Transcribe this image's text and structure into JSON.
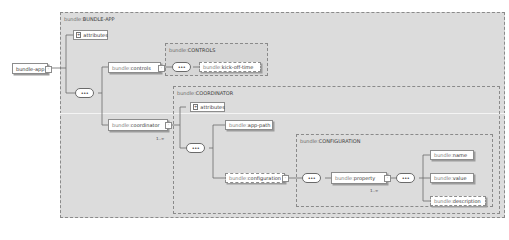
{
  "groups": {
    "bundle_app": {
      "ns": "bundle:",
      "name": "BUNDLE-APP"
    },
    "controls": {
      "ns": "bundle:",
      "name": "CONTROLS"
    },
    "coordinator": {
      "ns": "bundle:",
      "name": "COORDINATOR"
    },
    "configuration": {
      "ns": "bundle:",
      "name": "CONFIGURATION"
    }
  },
  "nodes": {
    "root": {
      "label": "bundle-app"
    },
    "attributes_1": {
      "label": "attributes"
    },
    "controls": {
      "ns": "bundle:",
      "label": "controls"
    },
    "kick_off_time": {
      "ns": "bundle:",
      "label": "kick-off-time"
    },
    "coordinator": {
      "ns": "bundle:",
      "label": "coordinator"
    },
    "attributes_2": {
      "label": "attributes"
    },
    "app_path": {
      "ns": "bundle:",
      "label": "app-path"
    },
    "configuration": {
      "ns": "bundle:",
      "label": "configuration"
    },
    "property": {
      "ns": "bundle:",
      "label": "property"
    },
    "name": {
      "ns": "bundle:",
      "label": "name"
    },
    "value": {
      "ns": "bundle:",
      "label": "value"
    },
    "description": {
      "ns": "bundle:",
      "label": "description"
    }
  },
  "cardinality": {
    "coordinator": "1..∞",
    "property": "1..∞"
  },
  "icons": {
    "sequence": "•••",
    "expand": "-",
    "attributes_plus": "+"
  }
}
